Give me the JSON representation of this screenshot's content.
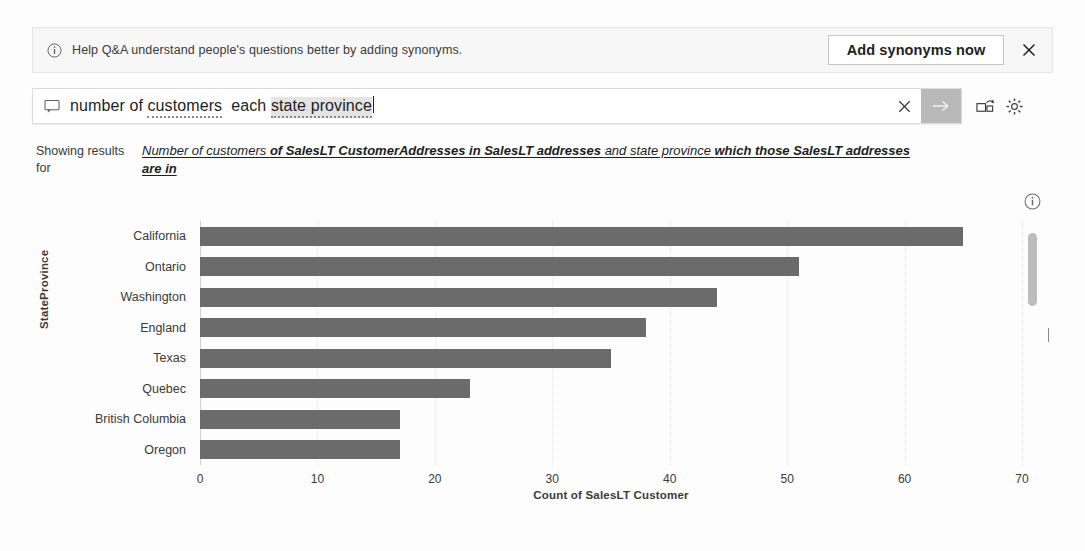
{
  "notification": {
    "icon": "info-circle-icon",
    "message": "Help Q&A understand people's questions better by adding synonyms.",
    "action_label": "Add synonyms now",
    "close_icon": "close-icon"
  },
  "query_box": {
    "prompt_icon": "chat-bubble-icon",
    "placeholder": "Ask a question about your data",
    "value": "number of customers each state province",
    "tokens": [
      {
        "text": "number of ",
        "style": "plain"
      },
      {
        "text": "customers",
        "style": "underline"
      },
      {
        "text": "  each ",
        "style": "plain"
      },
      {
        "text": "state province",
        "style": "highlight"
      }
    ],
    "clear_icon": "close-icon",
    "submit_icon": "arrow-right-icon",
    "visual_icon": "convert-to-visual-icon",
    "settings_icon": "gear-icon",
    "accent_submit_bg": "#b9b9b9"
  },
  "showing_results": {
    "label": "Showing results for",
    "restatement_parts": [
      {
        "text": "Number of customers ",
        "bold": false
      },
      {
        "text": "of SalesLT CustomerAddresses in SalesLT addresses ",
        "bold": true
      },
      {
        "text": "and state province ",
        "bold": false
      },
      {
        "text": "which those SalesLT addresses are in",
        "bold": true
      }
    ],
    "restatement_full": "Number of customers of SalesLT CustomerAddresses in SalesLT addresses and state province which those SalesLT addresses are in"
  },
  "chart_panel": {
    "info_icon": "info-circle-icon",
    "scrollbar": "vertical-scrollbar"
  },
  "chart_data": {
    "type": "bar",
    "orientation": "horizontal",
    "title": "",
    "subtitle": "",
    "xlabel": "Count of SalesLT Customer",
    "ylabel": "StateProvince",
    "categories": [
      "California",
      "Ontario",
      "Washington",
      "England",
      "Texas",
      "Quebec",
      "British Columbia",
      "Oregon"
    ],
    "values": [
      65,
      51,
      44,
      38,
      35,
      23,
      17,
      17
    ],
    "xlim": [
      0,
      70
    ],
    "xticks": [
      0,
      10,
      20,
      30,
      40,
      50,
      60,
      70
    ],
    "xtick_labels": [
      "0",
      "10",
      "20",
      "30",
      "40",
      "50",
      "60",
      "70"
    ],
    "grid": true,
    "legend": false,
    "bar_color": "#6b6b6b"
  }
}
